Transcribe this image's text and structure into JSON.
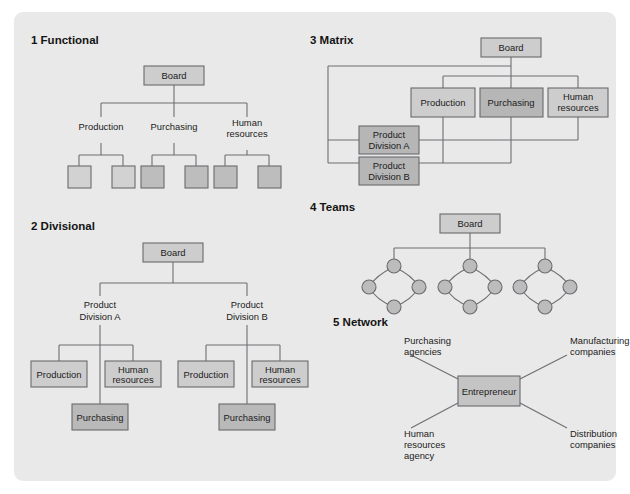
{
  "figure": {
    "panel_color": "#e9e9e9",
    "page_color": "#ffffff",
    "line_color": "#6e6e73",
    "box_border_color": "#6b6b70",
    "fill_light": "#d4d4d4",
    "fill_mid": "#c9c9c9",
    "fill_dark": "#b6b6b6",
    "text_color": "#1b1b1b"
  },
  "sections": [
    {
      "id": "functional",
      "number": "1",
      "heading": "1 Functional",
      "nodes": {
        "board": "Board",
        "production": "Production",
        "purchasing": "Purchasing",
        "human_resources": "Human resources",
        "human_resources_line1": "Human",
        "human_resources_line2": "resources"
      },
      "leaf_units": [
        "",
        "",
        "",
        "",
        "",
        ""
      ]
    },
    {
      "id": "divisional",
      "number": "2",
      "heading": "2 Divisional",
      "nodes": {
        "board": "Board",
        "division_a_line1": "Product",
        "division_a_line2": "Division A",
        "division_b_line1": "Product",
        "division_b_line2": "Division B",
        "production": "Production",
        "human_resources_line1": "Human",
        "human_resources_line2": "resources",
        "purchasing": "Purchasing"
      }
    },
    {
      "id": "matrix",
      "number": "3",
      "heading": "3 Matrix",
      "nodes": {
        "board": "Board",
        "production": "Production",
        "purchasing": "Purchasing",
        "human_resources_line1": "Human",
        "human_resources_line2": "resources",
        "division_a_line1": "Product",
        "division_a_line2": "Division A",
        "division_b_line1": "Product",
        "division_b_line2": "Division B"
      }
    },
    {
      "id": "teams",
      "number": "4",
      "heading": "4 Teams",
      "nodes": {
        "board": "Board"
      },
      "team_count": 3,
      "nodes_per_team": 4
    },
    {
      "id": "network",
      "number": "5",
      "heading": "5 Network",
      "nodes": {
        "center": "Entrepreneur",
        "top_left_line1": "Purchasing",
        "top_left_line2": "agencies",
        "top_right_line1": "Manufacturing",
        "top_right_line2": "companies",
        "bottom_left_line1": "Human",
        "bottom_left_line2": "resources",
        "bottom_left_line3": "agency",
        "bottom_right_line1": "Distribution",
        "bottom_right_line2": "companies"
      }
    }
  ]
}
